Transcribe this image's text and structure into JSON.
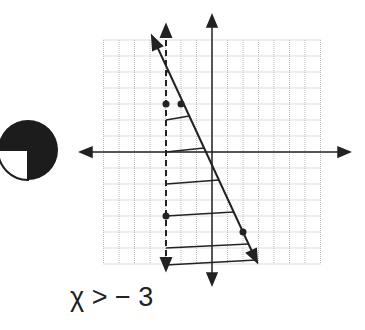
{
  "graph": {
    "x_axis_label": "",
    "y_axis_label": "",
    "grid_units": {
      "xmin": -7,
      "xmax": 7,
      "ymin": -7,
      "ymax": 7
    },
    "boundary_lines": [
      {
        "name": "dashed-vertical",
        "equation": "x = -3",
        "style": "dashed"
      },
      {
        "name": "solid-line",
        "equation": "y = -2x - 1",
        "style": "solid",
        "points": [
          [
            -2,
            3
          ],
          [
            2,
            -5
          ]
        ]
      }
    ],
    "marked_points": [
      [
        -3,
        3
      ],
      [
        -2,
        3
      ],
      [
        -3,
        -4
      ],
      [
        2,
        -5
      ]
    ],
    "shading": "horizontal hatch between x = -3 and y = -2x - 1"
  },
  "caption": "χ > − 3",
  "badge_icon": "three-quarter-filled-circle"
}
